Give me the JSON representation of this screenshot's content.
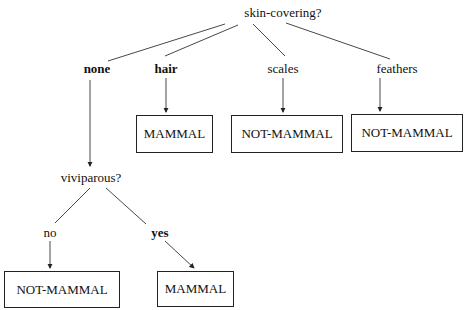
{
  "diagram": {
    "type": "decision-tree",
    "root": {
      "label": "skin-covering?",
      "x": 283,
      "y": 13
    },
    "branches": [
      {
        "label": "none",
        "bold": true,
        "x": 97,
        "y": 69
      },
      {
        "label": "hair",
        "bold": true,
        "x": 166,
        "y": 69
      },
      {
        "label": "scales",
        "bold": false,
        "x": 283,
        "y": 69
      },
      {
        "label": "feathers",
        "bold": false,
        "x": 397,
        "y": 69
      }
    ],
    "subnode": {
      "label": "viviparous?",
      "x": 91,
      "y": 178
    },
    "sub_branches": [
      {
        "label": "no",
        "bold": false,
        "x": 50,
        "y": 233
      },
      {
        "label": "yes",
        "bold": true,
        "x": 160,
        "y": 233
      }
    ],
    "leaves": [
      {
        "label": "MAMMAL",
        "x": 136,
        "y": 115,
        "w": 77,
        "h": 38
      },
      {
        "label": "NOT-MAMMAL",
        "x": 231,
        "y": 115,
        "w": 112,
        "h": 38
      },
      {
        "label": "NOT-MAMMAL",
        "x": 351,
        "y": 114,
        "w": 112,
        "h": 38
      },
      {
        "label": "NOT-MAMMAL",
        "x": 4,
        "y": 271,
        "w": 116,
        "h": 37
      },
      {
        "label": "MAMMAL",
        "x": 157,
        "y": 271,
        "w": 77,
        "h": 36
      }
    ]
  }
}
